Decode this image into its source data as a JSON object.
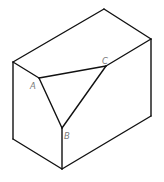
{
  "figure": {
    "type": "isometric cuboid with a corner cut off (triangular section ABC)",
    "labels": {
      "A": "A",
      "B": "B",
      "C": "C"
    },
    "colors": {
      "line": "#111111",
      "label": "#7a7a7a",
      "background": "#ffffff"
    }
  }
}
